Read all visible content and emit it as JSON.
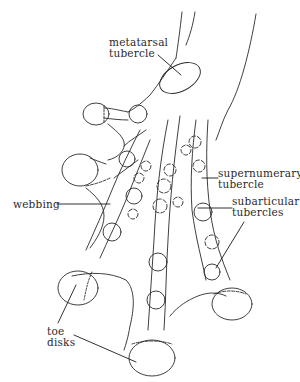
{
  "figure": {
    "stroke_color": "#2a2a2a",
    "background": "#ffffff"
  },
  "labels": {
    "metatarsal_tubercle": {
      "line1": "metatarsal",
      "line2": "tubercle"
    },
    "supernumerary_tubercle": {
      "line1": "supernumerary",
      "line2": "tubercle"
    },
    "subarticular_tubercles": {
      "line1": "subarticular",
      "line2": "tubercles"
    },
    "webbing": {
      "line1": "webbing"
    },
    "toe_disks": {
      "line1": "toe",
      "line2": "disks"
    }
  }
}
